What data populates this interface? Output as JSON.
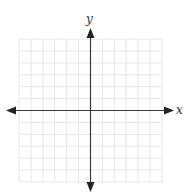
{
  "figure": {
    "type": "coordinate-plane",
    "x_axis_label": "x",
    "y_axis_label": "y",
    "grid": {
      "cells_left": 6,
      "cells_right": 6,
      "cells_up": 6,
      "cells_down": 6,
      "line_color": "#e6e6e6",
      "axis_color": "#3a3a3a"
    }
  }
}
